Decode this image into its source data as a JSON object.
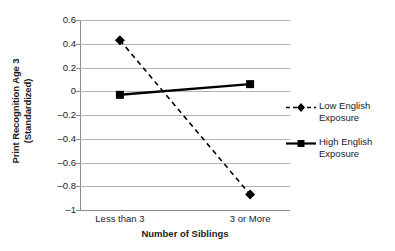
{
  "chart_data": {
    "type": "line",
    "title": "",
    "xlabel": "Number of Siblings",
    "ylabel_line1": "Print Recognition Age 3",
    "ylabel_line2": "(Standardized)",
    "categories": [
      "Less than 3",
      "3 or More"
    ],
    "ylim": [
      -1,
      0.6
    ],
    "yticks": [
      0.6,
      0.4,
      0.2,
      0,
      -0.2,
      -0.4,
      -0.6,
      -0.8,
      -1
    ],
    "ytick_labels": [
      "0.6",
      "0.4",
      "0.2",
      "0",
      "–0.2",
      "–0.4",
      "–0.6",
      "–0.8",
      "–1"
    ],
    "grid": true,
    "legend_position": "right",
    "series": [
      {
        "name": "Low English Exposure",
        "name_line1": "Low English",
        "name_line2": "Exposure",
        "values": [
          0.43,
          -0.87
        ],
        "style": "dashed",
        "marker": "diamond",
        "color": "#000000"
      },
      {
        "name": "High English Exposure",
        "name_line1": "High English",
        "name_line2": "Exposure",
        "values": [
          -0.03,
          0.06
        ],
        "style": "solid",
        "marker": "square",
        "color": "#000000"
      }
    ]
  }
}
